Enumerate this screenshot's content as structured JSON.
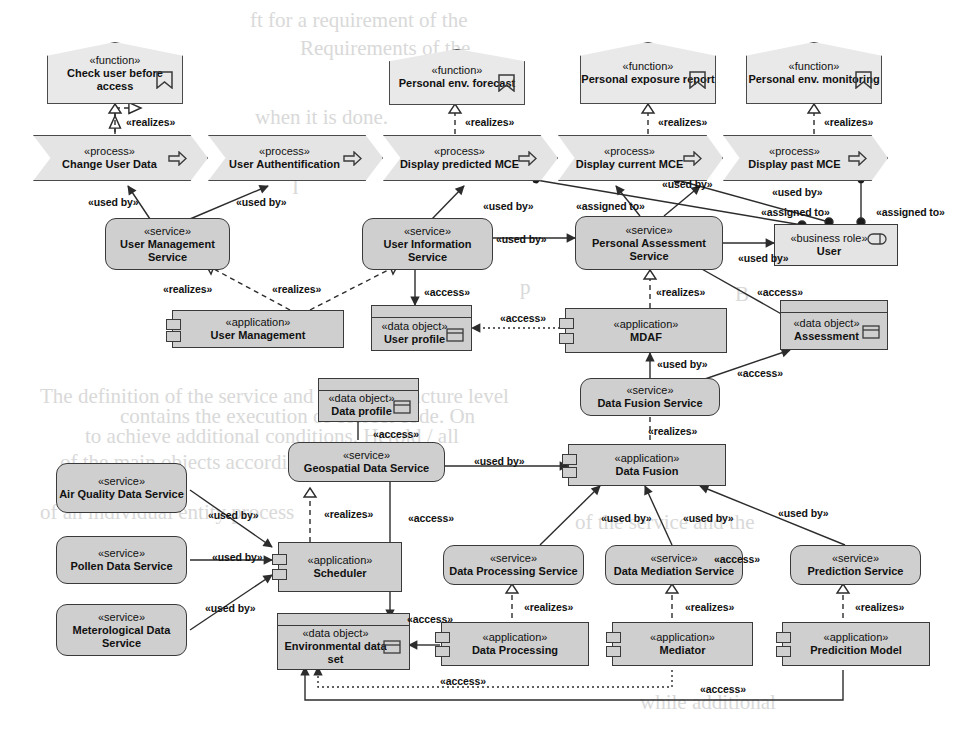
{
  "meta": {
    "diagram_type": "ArchiMate layered architecture diagram",
    "colors": {
      "service_fill": "#cfcfcf",
      "application_fill": "#cfcfcf",
      "data_object_fill": "#cfcfcf",
      "function_fill": "#e9e9e9",
      "process_fill": "#e4e4e4",
      "role_fill": "#e4e4e4",
      "stroke": "#3a3a3a",
      "page_background": "#ffffff"
    }
  },
  "background_text": [
    {
      "text": "ft for a requirement of the",
      "x": 250,
      "y": 8
    },
    {
      "text": "Requirements of the",
      "x": 300,
      "y": 36
    },
    {
      "text": "when it is done.",
      "x": 255,
      "y": 105
    },
    {
      "text": "I",
      "x": 292,
      "y": 175
    },
    {
      "text": "p",
      "x": 520,
      "y": 275
    },
    {
      "text": "B",
      "x": 735,
      "y": 282
    },
    {
      "text": "The definition of the service and the infrastructure level",
      "x": 40,
      "y": 384
    },
    {
      "text": "contains the execution of correct code. On",
      "x": 120,
      "y": 404
    },
    {
      "text": "to achieve additional conditions. Herold / all",
      "x": 85,
      "y": 424
    },
    {
      "text": "of the main objects according to a",
      "x": 60,
      "y": 450
    },
    {
      "text": "of an individual entity process",
      "x": 40,
      "y": 500
    },
    {
      "text": "of the service and the",
      "x": 575,
      "y": 510
    },
    {
      "text": "while additional",
      "x": 640,
      "y": 690
    }
  ],
  "nodes": {
    "func_check_user": {
      "stereotype": "«function»",
      "name": "Check user before access",
      "kind": "business-function",
      "icon": "function-icon"
    },
    "func_env_forecast": {
      "stereotype": "«function»",
      "name": "Personal env. forecast",
      "kind": "business-function",
      "icon": "function-icon"
    },
    "func_exposure_report": {
      "stereotype": "«function»",
      "name": "Personal exposure report",
      "kind": "business-function",
      "icon": "function-icon"
    },
    "func_env_monitoring": {
      "stereotype": "«function»",
      "name": "Personal env. monitoring",
      "kind": "business-function",
      "icon": "function-icon"
    },
    "proc_change_user_data": {
      "stereotype": "«process»",
      "name": "Change User Data",
      "kind": "business-process",
      "icon": "process-arrow-icon"
    },
    "proc_user_auth": {
      "stereotype": "«process»",
      "name": "User Authentification",
      "kind": "business-process",
      "icon": "process-arrow-icon"
    },
    "proc_display_predicted": {
      "stereotype": "«process»",
      "name": "Display predicted MCE",
      "kind": "business-process",
      "icon": "process-arrow-icon"
    },
    "proc_display_current": {
      "stereotype": "«process»",
      "name": "Display current MCE",
      "kind": "business-process",
      "icon": "process-arrow-icon"
    },
    "proc_display_past": {
      "stereotype": "«process»",
      "name": "Display past MCE",
      "kind": "business-process",
      "icon": "process-arrow-icon"
    },
    "svc_user_management": {
      "stereotype": "«service»",
      "name": "User Management Service",
      "kind": "application-service"
    },
    "svc_user_information": {
      "stereotype": "«service»",
      "name": "User Information Service",
      "kind": "application-service"
    },
    "svc_personal_assessment": {
      "stereotype": "«service»",
      "name": "Personal Assessment Service",
      "kind": "application-service"
    },
    "svc_data_fusion": {
      "stereotype": "«service»",
      "name": "Data Fusion Service",
      "kind": "application-service"
    },
    "svc_geospatial": {
      "stereotype": "«service»",
      "name": "Geospatial Data Service",
      "kind": "application-service"
    },
    "svc_air_quality": {
      "stereotype": "«service»",
      "name": "Air Quality Data Service",
      "kind": "application-service"
    },
    "svc_pollen": {
      "stereotype": "«service»",
      "name": "Pollen Data Service",
      "kind": "application-service"
    },
    "svc_meteorological": {
      "stereotype": "«service»",
      "name": "Meterological Data Service",
      "kind": "application-service"
    },
    "svc_data_processing": {
      "stereotype": "«service»",
      "name": "Data Processing Service",
      "kind": "application-service"
    },
    "svc_data_mediation": {
      "stereotype": "«service»",
      "name": "Data Mediation Service",
      "kind": "application-service"
    },
    "svc_prediction": {
      "stereotype": "«service»",
      "name": "Prediction Service",
      "kind": "application-service"
    },
    "app_user_management": {
      "stereotype": "«application»",
      "name": "User Management",
      "kind": "application-component"
    },
    "app_mdaf": {
      "stereotype": "«application»",
      "name": "MDAF",
      "kind": "application-component"
    },
    "app_data_fusion": {
      "stereotype": "«application»",
      "name": "Data Fusion",
      "kind": "application-component"
    },
    "app_scheduler": {
      "stereotype": "«application»",
      "name": "Scheduler",
      "kind": "application-component"
    },
    "app_data_processing": {
      "stereotype": "«application»",
      "name": "Data Processing",
      "kind": "application-component"
    },
    "app_mediator": {
      "stereotype": "«application»",
      "name": "Mediator",
      "kind": "application-component"
    },
    "app_prediction_model": {
      "stereotype": "«application»",
      "name": "Predicition Model",
      "kind": "application-component"
    },
    "do_user_profile": {
      "stereotype": "«data object»",
      "name": "User profile",
      "kind": "data-object",
      "icon": "data-object-icon"
    },
    "do_data_profile": {
      "stereotype": "«data object»",
      "name": "Data profile",
      "kind": "data-object",
      "icon": "data-object-icon"
    },
    "do_assessment": {
      "stereotype": "«data object»",
      "name": "Assessment",
      "kind": "data-object",
      "icon": "data-object-icon"
    },
    "do_environmental": {
      "stereotype": "«data object»",
      "name": "Environmental data set",
      "kind": "data-object",
      "icon": "data-object-icon"
    },
    "role_user": {
      "stereotype": "«business role»",
      "name": "User",
      "kind": "business-role",
      "icon": "business-role-icon"
    }
  },
  "edge_labels": [
    {
      "id": "r1",
      "text": "«realizes»",
      "x": 126,
      "y": 116
    },
    {
      "id": "r2",
      "text": "«realizes»",
      "x": 465,
      "y": 116
    },
    {
      "id": "r3",
      "text": "«realizes»",
      "x": 658,
      "y": 116
    },
    {
      "id": "r4",
      "text": "«realizes»",
      "x": 824,
      "y": 116
    },
    {
      "id": "u1",
      "text": "«used by»",
      "x": 88,
      "y": 196
    },
    {
      "id": "u2",
      "text": "«used by»",
      "x": 236,
      "y": 196
    },
    {
      "id": "u3",
      "text": "«used by»",
      "x": 483,
      "y": 200
    },
    {
      "id": "a1",
      "text": "«assigned to»",
      "x": 576,
      "y": 200
    },
    {
      "id": "u4",
      "text": "«used by»",
      "x": 662,
      "y": 178
    },
    {
      "id": "u5",
      "text": "«used by»",
      "x": 772,
      "y": 186
    },
    {
      "id": "a2",
      "text": "«assigned to»",
      "x": 761,
      "y": 206
    },
    {
      "id": "a3",
      "text": "«assigned to»",
      "x": 876,
      "y": 206
    },
    {
      "id": "u6",
      "text": "«used by»",
      "x": 496,
      "y": 233
    },
    {
      "id": "u7",
      "text": "«used by»",
      "x": 738,
      "y": 252
    },
    {
      "id": "r5",
      "text": "«realizes»",
      "x": 163,
      "y": 283
    },
    {
      "id": "r6",
      "text": "«realizes»",
      "x": 272,
      "y": 283
    },
    {
      "id": "ac1",
      "text": "«access»",
      "x": 424,
      "y": 286
    },
    {
      "id": "ac2",
      "text": "«access»",
      "x": 500,
      "y": 312
    },
    {
      "id": "r7",
      "text": "«realizes»",
      "x": 656,
      "y": 286
    },
    {
      "id": "ac3",
      "text": "«access»",
      "x": 757,
      "y": 286
    },
    {
      "id": "u8",
      "text": "«used by»",
      "x": 657,
      "y": 358
    },
    {
      "id": "ac4",
      "text": "«access»",
      "x": 737,
      "y": 367
    },
    {
      "id": "ac5",
      "text": "«access»",
      "x": 373,
      "y": 428
    },
    {
      "id": "r8",
      "text": "«realizes»",
      "x": 648,
      "y": 425
    },
    {
      "id": "u9",
      "text": "«used by»",
      "x": 474,
      "y": 455
    },
    {
      "id": "r9",
      "text": "«realizes»",
      "x": 324,
      "y": 508
    },
    {
      "id": "ac6",
      "text": "«access»",
      "x": 408,
      "y": 512
    },
    {
      "id": "u10",
      "text": "«used by»",
      "x": 208,
      "y": 509
    },
    {
      "id": "u11",
      "text": "«used by»",
      "x": 601,
      "y": 512
    },
    {
      "id": "u12",
      "text": "«used by»",
      "x": 683,
      "y": 512
    },
    {
      "id": "u13",
      "text": "«used by»",
      "x": 778,
      "y": 507
    },
    {
      "id": "u14",
      "text": "«used by»",
      "x": 212,
      "y": 551
    },
    {
      "id": "u15",
      "text": "«used by»",
      "x": 205,
      "y": 602
    },
    {
      "id": "ac7",
      "text": "«access»",
      "x": 714,
      "y": 553
    },
    {
      "id": "r10",
      "text": "«realizes»",
      "x": 524,
      "y": 601
    },
    {
      "id": "r11",
      "text": "«realizes»",
      "x": 685,
      "y": 601
    },
    {
      "id": "r12",
      "text": "«realizes»",
      "x": 855,
      "y": 601
    },
    {
      "id": "ac8",
      "text": "«access»",
      "x": 407,
      "y": 613
    },
    {
      "id": "ac9",
      "text": "«access»",
      "x": 440,
      "y": 675
    },
    {
      "id": "ac10",
      "text": "«access»",
      "x": 700,
      "y": 683
    }
  ]
}
